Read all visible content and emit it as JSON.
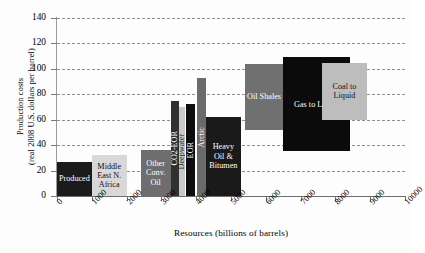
{
  "chart_data": {
    "type": "bar",
    "title": "",
    "xlabel": "Resources (billions of barrels)",
    "ylabel": "Production costs\n(real 2008 U.S. dollars per barrel)",
    "ylabel_line1": "Production costs",
    "ylabel_line2": "(real 2008 U.S. dollars per barrel)",
    "xlim": [
      0,
      10000
    ],
    "ylim": [
      0,
      140
    ],
    "xticks": [
      0,
      1000,
      2000,
      3000,
      4000,
      5000,
      6000,
      7000,
      8000,
      9000,
      10000
    ],
    "xtick_labels": [
      "0",
      "1000",
      "2000",
      "3000",
      "4000",
      "5000",
      "6000",
      "7000",
      "8000",
      "9000",
      "10000"
    ],
    "yticks": [
      0,
      20,
      40,
      60,
      80,
      100,
      120,
      140
    ],
    "ytick_labels": [
      "0",
      "20",
      "40",
      "60",
      "80",
      "100",
      "120",
      "140"
    ],
    "grid": "horizontal-dashed",
    "legend": "none",
    "note": "Supply cost curve: each block spans a resource range on x and a cost range on y",
    "bars": [
      {
        "label": "Produced",
        "x0": 0,
        "x1": 1000,
        "y0": 0,
        "y1": 27,
        "color": "#1b1b1b",
        "text_color": "#ffffff",
        "orient": "horizontal"
      },
      {
        "label": "Middle East N. Africa",
        "x0": 1000,
        "x1": 2000,
        "y0": 0,
        "y1": 32,
        "color": "#d8d8d8",
        "text_color": "#111111",
        "orient": "horizontal"
      },
      {
        "label": "Other Conv. Oil",
        "x0": 2400,
        "x1": 3270,
        "y0": 0,
        "y1": 36,
        "color": "#6e6e6e",
        "text_color": "#ffffff",
        "orient": "horizontal"
      },
      {
        "label": "CO2-EOR",
        "x0": 3270,
        "x1": 3500,
        "y0": 0,
        "y1": 75,
        "color": "#303030",
        "text_color": "#ffffff",
        "orient": "vertical"
      },
      {
        "label": "Deepwater",
        "x0": 3500,
        "x1": 3670,
        "y0": 0,
        "y1": 70,
        "color": "#c9c9c9",
        "text_color": "#222222",
        "orient": "vertical"
      },
      {
        "label": "EOR",
        "x0": 3700,
        "x1": 3980,
        "y0": 0,
        "y1": 72,
        "color": "#0d0d0d",
        "text_color": "#ffffff",
        "orient": "vertical"
      },
      {
        "label": "Arctic",
        "x0": 4020,
        "x1": 4280,
        "y0": 0,
        "y1": 93,
        "color": "#6b6b6b",
        "text_color": "#ffffff",
        "orient": "vertical"
      },
      {
        "label": "Heavy Oil & Bitumen",
        "x0": 4280,
        "x1": 5280,
        "y0": 0,
        "y1": 62,
        "color": "#1a1a1a",
        "text_color": "#ffffff",
        "orient": "horizontal"
      },
      {
        "label": "Oil Shales",
        "x0": 5400,
        "x1": 6500,
        "y0": 52,
        "y1": 104,
        "color": "#707070",
        "text_color": "#ffffff",
        "orient": "horizontal"
      },
      {
        "label": "Gas to Liquid",
        "x0": 6500,
        "x1": 8420,
        "y0": 35,
        "y1": 109,
        "color": "#0b0b0b",
        "text_color": "#ffffff",
        "orient": "horizontal"
      },
      {
        "label": "Coal to Liquid",
        "x0": 7620,
        "x1": 8900,
        "y0": 60,
        "y1": 105,
        "color": "#bdbdbd",
        "text_color": "#111111",
        "orient": "horizontal"
      }
    ]
  }
}
